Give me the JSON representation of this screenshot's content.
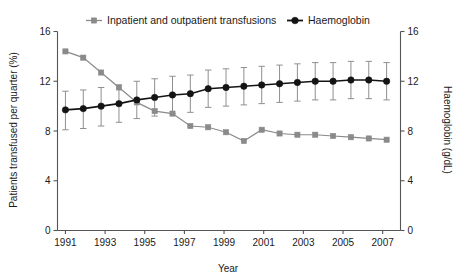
{
  "chart_data": {
    "type": "line",
    "title": "",
    "xlabel": "Year",
    "ylabel": "Patients transfused per quarter (%)",
    "y2label": "Haemoglobin (g/dL)",
    "xlim": [
      1990.6,
      2007.9
    ],
    "ylim": [
      0,
      16
    ],
    "y2lim": [
      0,
      16
    ],
    "grid": false,
    "legend_position": "top",
    "yticks": [
      0,
      4,
      8,
      12,
      16
    ],
    "y2ticks": [
      0,
      4,
      8,
      12,
      16
    ],
    "xticks": [
      1991,
      1993,
      1995,
      1997,
      1999,
      2001,
      2003,
      2005,
      2007
    ],
    "xticklabels": [
      "1991",
      "1993",
      "1995",
      "1997",
      "1999",
      "2001",
      "2003",
      "2005",
      "2007"
    ],
    "yticklabels": [
      "0",
      "4",
      "8",
      "12",
      "16"
    ],
    "y2ticklabels": [
      "0",
      "4",
      "8",
      "12",
      "16"
    ],
    "series": [
      {
        "name": "Inpatient and outpatient transfusions",
        "marker": "square",
        "color": "#8a8a8a",
        "axis": "left",
        "x": [
          1991.0,
          1991.9,
          1992.8,
          1993.7,
          1994.6,
          1995.5,
          1996.4,
          1997.3,
          1998.2,
          1999.1,
          2000.0,
          2000.9,
          2001.8,
          2002.7,
          2003.6,
          2004.5,
          2005.4,
          2006.3,
          2007.2
        ],
        "values": [
          14.4,
          13.9,
          12.7,
          11.5,
          10.3,
          9.6,
          9.4,
          8.4,
          8.3,
          7.9,
          7.2,
          8.1,
          7.8,
          7.7,
          7.7,
          7.6,
          7.5,
          7.4,
          7.3
        ]
      },
      {
        "name": "Haemoglobin",
        "marker": "circle",
        "color": "#141414",
        "axis": "right",
        "x": [
          1991.0,
          1991.9,
          1992.8,
          1993.7,
          1994.6,
          1995.5,
          1996.4,
          1997.3,
          1998.2,
          1999.1,
          2000.0,
          2000.9,
          2001.8,
          2002.7,
          2003.6,
          2004.5,
          2005.4,
          2006.3,
          2007.2
        ],
        "values": [
          9.7,
          9.8,
          10.0,
          10.2,
          10.5,
          10.7,
          10.9,
          11.0,
          11.4,
          11.5,
          11.6,
          11.7,
          11.8,
          11.9,
          12.0,
          12.0,
          12.1,
          12.1,
          12.0
        ],
        "error_low": [
          8.1,
          8.2,
          8.4,
          8.7,
          9.0,
          9.2,
          9.4,
          9.5,
          9.9,
          10.0,
          10.1,
          10.2,
          10.3,
          10.4,
          10.5,
          10.5,
          10.6,
          10.6,
          10.5
        ],
        "error_high": [
          11.2,
          11.3,
          11.5,
          11.7,
          12.0,
          12.2,
          12.4,
          12.5,
          12.9,
          13.0,
          13.1,
          13.2,
          13.3,
          13.4,
          13.5,
          13.5,
          13.6,
          13.6,
          13.5
        ]
      }
    ]
  },
  "legend": {
    "items": [
      {
        "label": "Inpatient and outpatient transfusions",
        "color": "#8a8a8a",
        "marker": "square"
      },
      {
        "label": "Haemoglobin",
        "color": "#141414",
        "marker": "circle"
      }
    ]
  },
  "axes": {
    "left_title": "Patients transfused per quarter (%)",
    "right_title": "Haemoglobin (g/dL)",
    "bottom_title": "Year"
  }
}
